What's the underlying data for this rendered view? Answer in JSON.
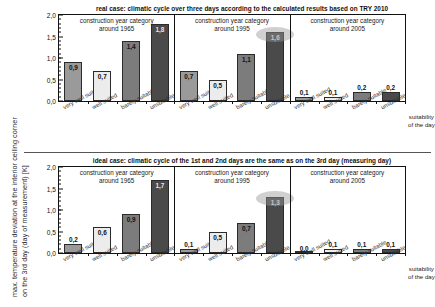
{
  "figure": {
    "ylabel_line1": "max. temperature deviation at the interior ceiling corner",
    "ylabel_line2": "on the 3rd day (day of measurement) [K]",
    "xaxis_title_line1": "suitability",
    "xaxis_title_line2": "of the day"
  },
  "axis": {
    "ticks": [
      "0,0",
      "0,5",
      "1,0",
      "1,5",
      "2,0"
    ],
    "tick_values": [
      0.0,
      0.5,
      1.0,
      1.5,
      2.0
    ],
    "ymin": 0.0,
    "ymax": 2.0
  },
  "groups": [
    {
      "line1": "construction year category",
      "line2": "around 1965"
    },
    {
      "line1": "construction year category",
      "line2": "around 1995"
    },
    {
      "line1": "construction year category",
      "line2": "around 2005"
    }
  ],
  "categories": [
    "very well suited",
    "well suited",
    "barely suitable",
    "unsuitable"
  ],
  "colors": {
    "very_well_suited": "#9a9a9a",
    "well_suited": "#ececec",
    "barely_suitable": "#7c7c7c",
    "unsuitable": "#4a4a4a",
    "highlight_ellipse": "#969696",
    "axis": "#111111"
  },
  "chart_data": [
    {
      "type": "bar",
      "title": "real case: climatic cycle over three days according to the calculated results based on TRY 2010",
      "xlabel": "suitability of the day",
      "ylabel": "max. temperature deviation at the interior ceiling corner on the 3rd day (day of measurement) [K]",
      "ylim": [
        0.0,
        2.0
      ],
      "yticks": [
        0.0,
        0.5,
        1.0,
        1.5,
        2.0
      ],
      "ytick_labels": [
        "0,0",
        "0,5",
        "1,0",
        "1,5",
        "2,0"
      ],
      "grid": false,
      "legend": "none",
      "groups": [
        "construction year category around 1965",
        "construction year category around 1995",
        "construction year category around 2005"
      ],
      "categories": [
        "very well suited",
        "well suited",
        "barely suitable",
        "unsuitable"
      ],
      "series": [
        {
          "name": "construction year category around 1965",
          "values": [
            0.9,
            0.7,
            1.4,
            1.8
          ],
          "labels": [
            "0,9",
            "0,7",
            "1,4",
            "1,8"
          ]
        },
        {
          "name": "construction year category around 1995",
          "values": [
            0.7,
            0.5,
            1.1,
            1.6
          ],
          "labels": [
            "0,7",
            "0,5",
            "1,1",
            "1,6"
          ]
        },
        {
          "name": "construction year category around 2005",
          "values": [
            0.1,
            0.1,
            0.2,
            0.2
          ],
          "labels": [
            "0,1",
            "0,1",
            "0,2",
            "0,2"
          ]
        }
      ],
      "annotations": [
        {
          "type": "ellipse-highlight",
          "group": "construction year category around 1995",
          "category": "unsuitable",
          "value": 1.6
        }
      ]
    },
    {
      "type": "bar",
      "title": "ideal case: climatic cycle of the 1st and 2nd days are the same as on the 3rd day (measuring day)",
      "xlabel": "suitability of the day",
      "ylabel": "max. temperature deviation at the interior ceiling corner on the 3rd day (day of measurement) [K]",
      "ylim": [
        0.0,
        2.0
      ],
      "yticks": [
        0.0,
        0.5,
        1.0,
        1.5,
        2.0
      ],
      "ytick_labels": [
        "0,0",
        "0,5",
        "1,0",
        "1,5",
        "2,0"
      ],
      "grid": false,
      "legend": "none",
      "groups": [
        "construction year category around 1965",
        "construction year category around 1995",
        "construction year category around 2005"
      ],
      "categories": [
        "very well suited",
        "well suited",
        "barely suitable",
        "unsuitable"
      ],
      "series": [
        {
          "name": "construction year category around 1965",
          "values": [
            0.2,
            0.6,
            0.9,
            1.7
          ],
          "labels": [
            "0,2",
            "0,6",
            "0,9",
            "1,7"
          ]
        },
        {
          "name": "construction year category around 1995",
          "values": [
            0.1,
            0.5,
            0.7,
            1.3
          ],
          "labels": [
            "0,1",
            "0,5",
            "0,7",
            "1,3"
          ]
        },
        {
          "name": "construction year category around 2005",
          "values": [
            0.0,
            0.1,
            0.1,
            0.1
          ],
          "labels": [
            "0,0",
            "0,1",
            "0,1",
            "0,1"
          ]
        }
      ],
      "annotations": [
        {
          "type": "ellipse-highlight",
          "group": "construction year category around 1995",
          "category": "unsuitable",
          "value": 1.3
        }
      ]
    }
  ]
}
